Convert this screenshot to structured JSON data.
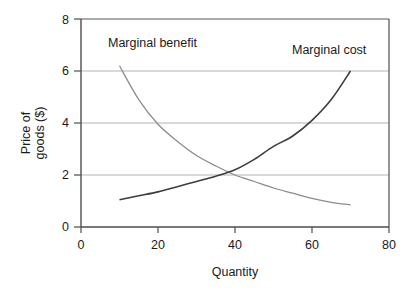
{
  "chart_data": {
    "type": "line",
    "title": "",
    "xlabel": "Quantity",
    "ylabel_line1": "Price of",
    "ylabel_line2": "goods ($)",
    "xlim": [
      0,
      80
    ],
    "ylim": [
      0,
      8
    ],
    "xticks": [
      "0",
      "20",
      "40",
      "60",
      "80"
    ],
    "xtick_values": [
      0,
      20,
      40,
      60,
      80
    ],
    "yticks": [
      "0",
      "2",
      "4",
      "6",
      "8"
    ],
    "ytick_values": [
      0,
      2,
      4,
      6,
      8
    ],
    "grid": "horizontal",
    "legend_position": "inline-annotations",
    "series": [
      {
        "name": "Marginal benefit",
        "color": "#8c8c8c",
        "shape": "decreasing-convex",
        "x": [
          10,
          15,
          20,
          25,
          30,
          35,
          40,
          45,
          50,
          55,
          60,
          65,
          70
        ],
        "values": [
          6.2,
          4.9,
          3.95,
          3.3,
          2.75,
          2.35,
          2.0,
          1.75,
          1.5,
          1.3,
          1.1,
          0.95,
          0.85
        ]
      },
      {
        "name": "Marginal cost",
        "color": "#3d3d3d",
        "shape": "increasing-convex",
        "x": [
          10,
          15,
          20,
          25,
          30,
          35,
          40,
          45,
          50,
          55,
          60,
          65,
          70
        ],
        "values": [
          1.05,
          1.2,
          1.35,
          1.55,
          1.75,
          1.95,
          2.2,
          2.6,
          3.1,
          3.5,
          4.1,
          4.9,
          6.0
        ]
      }
    ],
    "annotations": [
      {
        "text": "Marginal benefit",
        "x_px": 108,
        "y_px": 47
      },
      {
        "text": "Marginal cost",
        "x_px": 292,
        "y_px": 54
      }
    ],
    "intersection": {
      "x": 38,
      "y": 2.1
    },
    "colors": {
      "axis": "#4d4d4d",
      "grid": "#b3b3b3",
      "text": "#1a1a1a",
      "background": "#ffffff"
    }
  }
}
